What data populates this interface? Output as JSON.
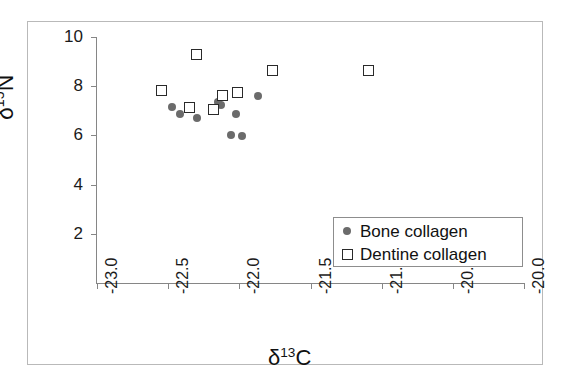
{
  "chart_data": {
    "type": "scatter",
    "title": "",
    "xlabel": "δ13C",
    "ylabel": "δ15N",
    "xlabel_base": "δ",
    "xlabel_sup": "13",
    "xlabel_tail": "C",
    "ylabel_base": "δ",
    "ylabel_sup": "15",
    "ylabel_tail": "N",
    "xlim": [
      -23.0,
      -20.0
    ],
    "ylim": [
      0,
      10
    ],
    "xticks": [
      -23.0,
      -22.5,
      -22.0,
      -21.5,
      -21.0,
      -20.5,
      -20.0
    ],
    "xticklabels": [
      "-23.0",
      "-22.5",
      "-22.0",
      "-21.5",
      "-21.0",
      "-20.5",
      "-20.0"
    ],
    "yticks": [
      2,
      4,
      6,
      8,
      10
    ],
    "yticklabels": [
      "2",
      "4",
      "6",
      "8",
      "10"
    ],
    "grid": false,
    "legend_position": "lower right",
    "series": [
      {
        "name": "Bone collagen",
        "marker": "filled-circle",
        "color": "#6b6b6b",
        "points": [
          {
            "x": -22.47,
            "y": 7.15
          },
          {
            "x": -22.42,
            "y": 6.87
          },
          {
            "x": -22.3,
            "y": 6.7
          },
          {
            "x": -22.15,
            "y": 7.35
          },
          {
            "x": -22.13,
            "y": 7.24
          },
          {
            "x": -22.06,
            "y": 6.0
          },
          {
            "x": -22.02,
            "y": 6.85
          },
          {
            "x": -21.98,
            "y": 5.98
          },
          {
            "x": -21.87,
            "y": 7.6
          }
        ]
      },
      {
        "name": "Dentine collagen",
        "marker": "open-square",
        "color": "#2a2a2a",
        "points": [
          {
            "x": -22.55,
            "y": 7.82
          },
          {
            "x": -22.3,
            "y": 9.3
          },
          {
            "x": -22.35,
            "y": 7.12
          },
          {
            "x": -22.18,
            "y": 7.05
          },
          {
            "x": -22.12,
            "y": 7.63
          },
          {
            "x": -22.01,
            "y": 7.75
          },
          {
            "x": -21.77,
            "y": 8.62
          },
          {
            "x": -21.09,
            "y": 8.62
          }
        ]
      }
    ]
  },
  "legend": {
    "items": [
      {
        "label": "Bone collagen",
        "marker": "filled-circle"
      },
      {
        "label": "Dentine collagen",
        "marker": "open-square"
      }
    ]
  }
}
